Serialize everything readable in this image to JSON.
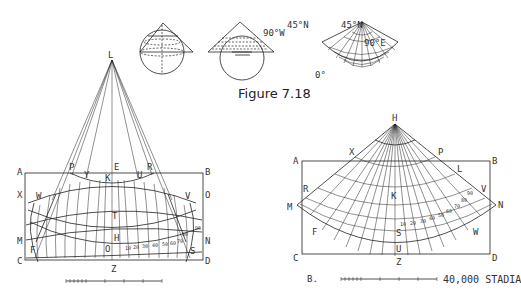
{
  "figure": {
    "caption": "Figure 7.18",
    "top_row": {
      "cone_1": {
        "description": "cone tangent to sphere"
      },
      "cone_2": {
        "description": "cone with graticule projection"
      },
      "fan": {
        "labels": {
          "n45_left": "45°N",
          "n45_right": "45°N",
          "w90": "90°W",
          "e90": "90°E",
          "zero": "0°"
        }
      }
    },
    "left_panel": {
      "apex": "L",
      "corner_labels": {
        "A": "A",
        "B": "B",
        "C": "C",
        "D": "D"
      },
      "side_labels": {
        "X": "X",
        "O": "O",
        "M": "M",
        "N": "N"
      },
      "inner_labels": {
        "P": "P",
        "Y": "Y",
        "E": "E",
        "K": "K",
        "U": "U",
        "R": "R",
        "W": "W",
        "V": "V",
        "T": "T",
        "H": "H",
        "Q": "O",
        "F": "F",
        "S": "S",
        "Z": "Z"
      },
      "lat_numbers": [
        "10",
        "20",
        "30",
        "40",
        "50",
        "60",
        "70",
        "80",
        "90"
      ]
    },
    "right_panel": {
      "apex": "H",
      "corner_labels": {
        "A": "A",
        "B": "B",
        "C": "C",
        "D": "D"
      },
      "side_labels": {
        "M": "M",
        "N": "N"
      },
      "inner_labels": {
        "X": "X",
        "P": "P",
        "L": "L",
        "R": "R",
        "V": "V",
        "K": "K",
        "F": "F",
        "W": "W",
        "S": "S",
        "U": "U",
        "Z": "Z"
      },
      "lat_numbers": [
        "10",
        "20",
        "30",
        "40",
        "50",
        "60",
        "70",
        "80",
        "90"
      ],
      "panel_label": "B.",
      "scale_label": "40,000 STADIA"
    }
  }
}
